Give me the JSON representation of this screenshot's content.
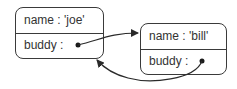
{
  "objects": [
    {
      "id": "joe",
      "fields": {
        "name": "name : 'joe'",
        "buddy": "buddy :"
      }
    },
    {
      "id": "bill",
      "fields": {
        "name": "name : 'bill'",
        "buddy": "buddy :"
      }
    }
  ],
  "arrows": [
    {
      "from": "joe.buddy",
      "to": "bill"
    },
    {
      "from": "bill.buddy",
      "to": "joe"
    }
  ]
}
